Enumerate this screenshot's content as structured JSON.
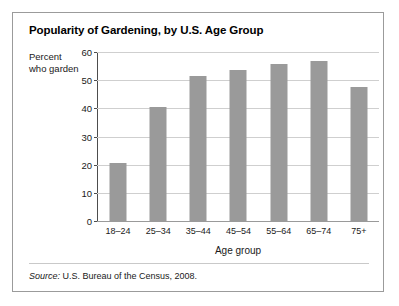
{
  "card": {
    "title": "Popularity of Gardening, by U.S. Age Group",
    "source_lead": "Source:",
    "source_text": " U.S. Bureau of the Census, 2008."
  },
  "chart_data": {
    "type": "bar",
    "title": "Popularity of Gardening, by U.S. Age Group",
    "categories": [
      "18–24",
      "25–34",
      "35–44",
      "45–54",
      "55–64",
      "65–74",
      "75+"
    ],
    "values": [
      21,
      41,
      52,
      54,
      56,
      57,
      48
    ],
    "xlabel": "Age group",
    "ylabel": "Percent\nwho garden",
    "ylim": [
      0,
      60
    ],
    "yticks": [
      0,
      10,
      20,
      30,
      40,
      50,
      60
    ],
    "ytick_labels": [
      "0",
      "10",
      "20",
      "30",
      "40",
      "50",
      "60"
    ],
    "grid": true,
    "legend": "none",
    "bar_color": "#9a9a9a",
    "axis_color": "#4d4d4d",
    "grid_color": "#cfcfcf"
  }
}
